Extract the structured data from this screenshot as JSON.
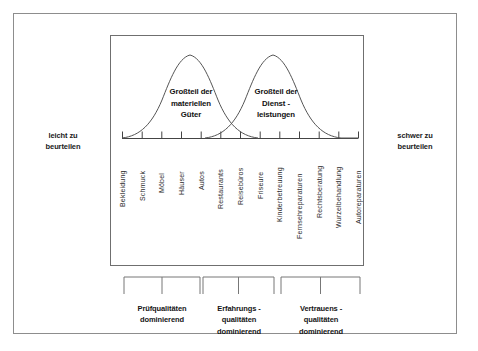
{
  "diagram": {
    "title_absent": true,
    "axis": {
      "left_label": "leicht zu\nbeurteilen",
      "left_label_line1": "leicht zu",
      "left_label_line2": "beurteilen",
      "right_label_line1": "schwer zu",
      "right_label_line2": "beurteilen",
      "x_start": 122,
      "x_end": 358,
      "y": 138,
      "tick_count": 13
    },
    "tick_labels": [
      "Bekleidung",
      "Schmuck",
      "Möbel",
      "Häuser",
      "Autos",
      "Restaurants",
      "Reisebüros",
      "Friseure",
      "Kinderbetreuung",
      "Fernsehreparaturen",
      "Rechtsberatung",
      "Wurzelbehandlung",
      "Autoreparaturen",
      "Ärztliche Diagnose"
    ],
    "curves": [
      {
        "name": "materielle-gueter",
        "annotation_line1": "Großteil der",
        "annotation_line2": "materiellen",
        "annotation_line3": "Güter",
        "peak_x": 190,
        "peak_y": 55
      },
      {
        "name": "dienstleistungen",
        "annotation_line1": "Großteil der",
        "annotation_line2": "Dienst -",
        "annotation_line3": "leistungen",
        "peak_x": 273,
        "peak_y": 55
      }
    ],
    "brackets": [
      {
        "name": "pruefqualitaeten",
        "x_start": 124,
        "x_end": 200,
        "label_line1": "Prüfqualitäten",
        "label_line2": "dominierend",
        "label_line3": ""
      },
      {
        "name": "erfahrungsqualitaeten",
        "x_start": 203,
        "x_end": 274,
        "label_line1": "Erfahrungs -",
        "label_line2": "qualitäten",
        "label_line3": "dominierend"
      },
      {
        "name": "vertrauensqualitaeten",
        "x_start": 281,
        "x_end": 360,
        "label_line1": "Vertrauens -",
        "label_line2": "qualitäten",
        "label_line3": "dominierend"
      }
    ],
    "colors": {
      "outer_border": "#8d8d8d",
      "inner_frame": "#6f6f6f",
      "curve_stroke": "#555555",
      "axis_stroke": "#444444",
      "bracket_stroke": "#777777",
      "text": "#1a1a1a",
      "background": "#ffffff"
    }
  }
}
